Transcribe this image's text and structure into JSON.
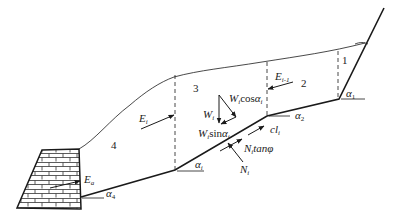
{
  "diagram": {
    "type": "slope-stability-slice-diagram",
    "slices": [
      {
        "id": "slice-1",
        "label": "1"
      },
      {
        "id": "slice-2",
        "label": "2"
      },
      {
        "id": "slice-3",
        "label": "3"
      },
      {
        "id": "slice-4",
        "label": "4"
      }
    ],
    "forces": {
      "E_i": {
        "main": "E",
        "sub": "i"
      },
      "E_i_minus_1": {
        "main": "E",
        "sub": "i-1"
      },
      "E_a": {
        "main": "E",
        "sub": "a"
      },
      "W_i": {
        "main": "W",
        "sub": "i"
      },
      "W_cos": {
        "main": "W",
        "sub": "i",
        "tail": "cos",
        "greek": "α",
        "gsub": "i"
      },
      "W_sin": {
        "main": "W",
        "sub": "i",
        "tail": "sin",
        "greek": "α",
        "gsub": "i"
      },
      "cl": {
        "main": "cl",
        "sub": "i"
      },
      "N_tan": {
        "main": "N",
        "sub": "i",
        "tail": "tanφ"
      },
      "N_i": {
        "main": "N",
        "sub": "i"
      }
    },
    "angles": {
      "alpha_1": {
        "main": "α",
        "sub": "1"
      },
      "alpha_2": {
        "main": "α",
        "sub": "2"
      },
      "alpha_i": {
        "main": "α",
        "sub": "i"
      },
      "alpha_4": {
        "main": "α",
        "sub": "4"
      }
    },
    "colors": {
      "line": "#1a1a1a",
      "background": "#ffffff"
    }
  }
}
